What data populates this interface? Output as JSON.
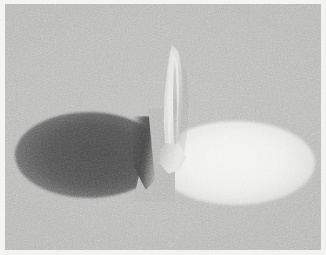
{
  "image": {
    "kind": "photograph",
    "title": "Upright pale leaf form between a dark cast shadow and a bright light pool",
    "orientation": "landscape",
    "width_px": 326,
    "height_px": 255,
    "border": {
      "style": "white print border",
      "color": "#f3f3f1",
      "left_px": 5,
      "top_px": 4,
      "right_px": 5,
      "bottom_px": 5
    },
    "background": {
      "description": "flat, evenly lit neutral gray studio surface with heavy film grain",
      "color": "#b4b4b2",
      "grain": "visible monochrome film grain"
    },
    "palette": {
      "background_gray": "#b4b4b2",
      "shadow_core": "#4f4f4f",
      "shadow_mid": "#5c5c5c",
      "highlight_core": "#f0f0ee",
      "highlight_mid": "#e6e6e4",
      "leaf_light": "#dcdcda",
      "leaf_mid": "#c6c6c4",
      "leaf_dark": "#a8a8a6",
      "border_white": "#f3f3f1"
    },
    "subjects": [
      {
        "name": "shadow-ellipse",
        "label": "Dark cast shadow",
        "shape": "ellipse",
        "tone": "dark gray",
        "position": "left of center, lower half",
        "center_px": [
          84,
          151
        ],
        "width_px": 148,
        "height_px": 86,
        "edges": "soft and diffuse on the left, sharply terminated on the right where it meets the object base"
      },
      {
        "name": "light-ellipse",
        "label": "Bright light pool",
        "shape": "ellipse",
        "tone": "near white",
        "position": "right of center, lower half",
        "center_px": [
          231,
          159
        ],
        "width_px": 158,
        "height_px": 84,
        "edges": "soft, gradually fading into the gray background on all sides"
      },
      {
        "name": "leaf-shape",
        "label": "Upright curved leaf form",
        "shape": "tapering curved blade, folded along a central crease",
        "tone": "pale gray, lighter than background",
        "position": "center, standing vertically between the two ellipses",
        "top_px": 41,
        "bottom_px": 161,
        "width_px": 34,
        "details": "lighter leading face on the left, a soft central crease, and a shaded right flank; flares slightly at the base"
      }
    ]
  }
}
